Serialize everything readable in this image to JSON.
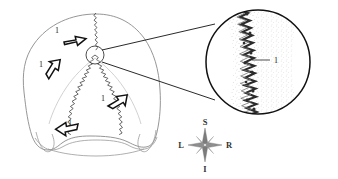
{
  "figure": {
    "background_color": "#ffffff",
    "ink_color": "#1a1a1a",
    "outline_color": "#8a8a8a",
    "suture_color": "#4a4a4a",
    "stipple_color": "#9a9a9a",
    "compass_color": "#6e6e6e",
    "main_view": {
      "name": "skull-posterior-view",
      "callout_circle_label": "",
      "arrow_labels": [
        {
          "id": "arrow-label-1a",
          "text": "1",
          "x": 57,
          "y": 33
        },
        {
          "id": "arrow-label-1b",
          "text": "1",
          "x": 41,
          "y": 67
        },
        {
          "id": "arrow-label-1c",
          "text": "1",
          "x": 103,
          "y": 101
        },
        {
          "id": "arrow-label-1d",
          "text": "1",
          "x": 70,
          "y": 126
        }
      ]
    },
    "inset": {
      "name": "magnified-suture-inset",
      "label": {
        "text": "1",
        "x": 274,
        "y": 63
      }
    },
    "compass": {
      "name": "anatomical-orientation-compass",
      "superior": "S",
      "inferior": "I",
      "left": "L",
      "right": "R"
    }
  }
}
